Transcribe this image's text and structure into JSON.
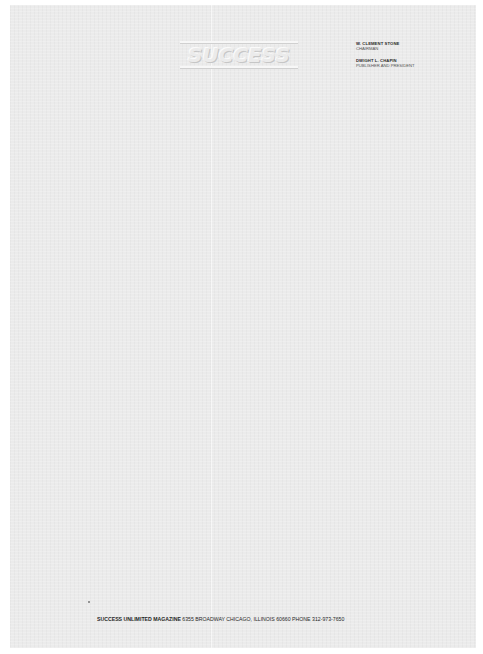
{
  "letterhead": {
    "logo_text": "SUCCESS",
    "officers": [
      {
        "name": "W. CLEMENT STONE",
        "title": "CHAIRMAN"
      },
      {
        "name": "DWIGHT L. CHAPIN",
        "title": "PUBLISHER AND PRESIDENT"
      }
    ]
  },
  "footer": {
    "organization": "SUCCESS UNLIMITED MAGAZINE",
    "address": "6355 BROADWAY CHICAGO, ILLINOIS 60660",
    "phone_label": "PHONE",
    "phone": "312-973-7650"
  },
  "colors": {
    "paper": "#ebebeb",
    "border": "#ffffff",
    "text": "#1e1e1e"
  }
}
